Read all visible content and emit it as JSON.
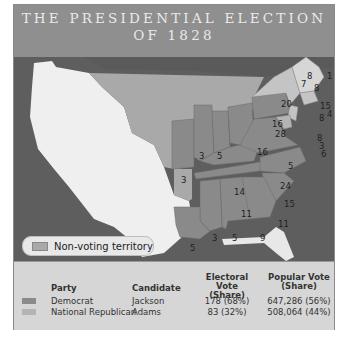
{
  "title": {
    "line1": "THE PRESIDENTIAL ELECTION",
    "line2": "OF 1828"
  },
  "map": {
    "legend_label": "Non-voting territory",
    "electoral_votes": [
      {
        "state": "ME",
        "votes": "1"
      },
      {
        "state": "ME-NH",
        "votes": "8"
      },
      {
        "state": "NH",
        "votes": "8"
      },
      {
        "state": "VT",
        "votes": "7"
      },
      {
        "state": "NY",
        "votes": "20"
      },
      {
        "state": "MA",
        "votes": "15"
      },
      {
        "state": "RI",
        "votes": "4"
      },
      {
        "state": "CT",
        "votes": "8"
      },
      {
        "state": "NJ",
        "votes": "8"
      },
      {
        "state": "DE",
        "votes": "3"
      },
      {
        "state": "MD",
        "votes": "6"
      },
      {
        "state": "PA",
        "votes": "28"
      },
      {
        "state": "OH",
        "votes": "16"
      },
      {
        "state": "OH-N",
        "votes": "16"
      },
      {
        "state": "IN",
        "votes": "5"
      },
      {
        "state": "IL",
        "votes": "3"
      },
      {
        "state": "MO",
        "votes": "3"
      },
      {
        "state": "KY",
        "votes": "14"
      },
      {
        "state": "VA",
        "votes": "24"
      },
      {
        "state": "MD-W",
        "votes": "5"
      },
      {
        "state": "TN",
        "votes": "11"
      },
      {
        "state": "NC",
        "votes": "15"
      },
      {
        "state": "SC",
        "votes": "11"
      },
      {
        "state": "GA",
        "votes": "9"
      },
      {
        "state": "AL",
        "votes": "5"
      },
      {
        "state": "MS",
        "votes": "3"
      },
      {
        "state": "LA",
        "votes": "5"
      }
    ]
  },
  "table": {
    "headers": {
      "party": "Party",
      "candidate": "Candidate",
      "electoral_1": "Electoral Vote",
      "electoral_2": "(Share)",
      "popular_1": "Popular Vote",
      "popular_2": "(Share)"
    },
    "rows": [
      {
        "party": "Democrat",
        "candidate": "Jackson",
        "electoral": "178 (68%)",
        "popular": "647,286 (56%)",
        "color": "#8a8a8a"
      },
      {
        "party": "National Republican",
        "candidate": "Adams",
        "electoral": "83 (32%)",
        "popular": "508,064 (44%)",
        "color": "#b4b4b4"
      }
    ]
  },
  "colors": {
    "democrat": "#8a8a8a",
    "national_republican": "#c4c4c4",
    "non_voting": "#a9a9a9",
    "foreign": "#efefef",
    "water": "#5e5e5e"
  }
}
